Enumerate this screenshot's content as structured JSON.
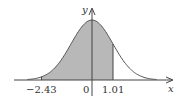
{
  "chart_data": {
    "type": "area",
    "title": "",
    "xlabel": "x",
    "ylabel": "y",
    "shaded_interval": [
      -2.43,
      1.01
    ],
    "tick_labels": [
      "-2.43",
      "0",
      "1.01"
    ],
    "x": [
      -3.0,
      -2.43,
      -2.0,
      -1.5,
      -1.0,
      -0.5,
      0,
      0.5,
      1.0,
      1.01,
      1.5,
      2.0,
      2.5,
      3.0
    ],
    "values": [
      0.0044,
      0.0208,
      0.054,
      0.1295,
      0.242,
      0.3521,
      0.3989,
      0.3521,
      0.242,
      0.2396,
      0.1295,
      0.054,
      0.0175,
      0.0044
    ],
    "fill_color": "#b8b8b8",
    "curve_color": "#555555"
  },
  "axes": {
    "x_label": "x",
    "y_label": "y"
  },
  "ticks": {
    "left": "−2.43",
    "zero": "0",
    "right": "1.01"
  }
}
